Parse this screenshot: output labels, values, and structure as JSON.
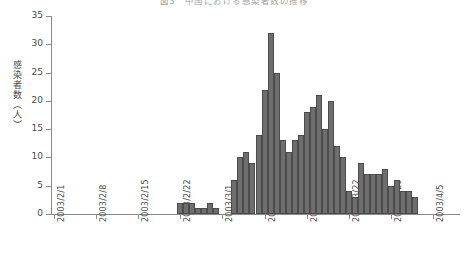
{
  "chart_data": {
    "type": "bar",
    "title": "図3　中国における感染者数の推移",
    "xlabel": "",
    "ylabel": "感染者数（人）",
    "ylim": [
      0,
      35
    ],
    "ytick_values": [
      0,
      5,
      10,
      15,
      20,
      25,
      30,
      35
    ],
    "ytick_labels": [
      "0",
      "5",
      "10",
      "15",
      "20",
      "25",
      "30",
      "35"
    ],
    "xtick_labels": [
      "2003/2/1",
      "2003/2/8",
      "2003/2/15",
      "2003/2/22",
      "2003/3/1",
      "2003/3/8",
      "2003/3/15",
      "2003/3/22",
      "2003/3/29",
      "2003/4/5"
    ],
    "xtick_positions_days": [
      0,
      7,
      14,
      21,
      28,
      35,
      42,
      49,
      56,
      63
    ],
    "grid": false,
    "legend": false,
    "bar_color": "#6e6e6e",
    "bar_edge_color": "#4c4c4c",
    "axis_color": "#8a8a8a",
    "x_start_label": "2003/2/1",
    "x_end_label": "2003/4/5",
    "categories": [
      "2003/2/1",
      "2003/2/2",
      "2003/2/3",
      "2003/2/4",
      "2003/2/5",
      "2003/2/6",
      "2003/2/7",
      "2003/2/8",
      "2003/2/9",
      "2003/2/10",
      "2003/2/11",
      "2003/2/12",
      "2003/2/13",
      "2003/2/14",
      "2003/2/15",
      "2003/2/16",
      "2003/2/17",
      "2003/2/18",
      "2003/2/19",
      "2003/2/20",
      "2003/2/21",
      "2003/2/22",
      "2003/2/23",
      "2003/2/24",
      "2003/2/25",
      "2003/2/26",
      "2003/2/27",
      "2003/2/28",
      "2003/3/1",
      "2003/3/2",
      "2003/3/3",
      "2003/3/4",
      "2003/3/5",
      "2003/3/6",
      "2003/3/7",
      "2003/3/8",
      "2003/3/9",
      "2003/3/10",
      "2003/3/11",
      "2003/3/12",
      "2003/3/13",
      "2003/3/14",
      "2003/3/15",
      "2003/3/16",
      "2003/3/17",
      "2003/3/18",
      "2003/3/19",
      "2003/3/20",
      "2003/3/21",
      "2003/3/22",
      "2003/3/23",
      "2003/3/24",
      "2003/3/25",
      "2003/3/26",
      "2003/3/27",
      "2003/3/28",
      "2003/3/29",
      "2003/3/30",
      "2003/3/31",
      "2003/4/1",
      "2003/4/2",
      "2003/4/3",
      "2003/4/4",
      "2003/4/5"
    ],
    "values": [
      0,
      0,
      0,
      0,
      0,
      0,
      0,
      0,
      0,
      0,
      0,
      0,
      0,
      0,
      0,
      0,
      0,
      0,
      0,
      0,
      0,
      2,
      2,
      2,
      1,
      1,
      2,
      1,
      0,
      0,
      6,
      10,
      11,
      9,
      14,
      22,
      32,
      25,
      13,
      11,
      13,
      14,
      18,
      19,
      21,
      15,
      20,
      12,
      10,
      4,
      3,
      9,
      7,
      7,
      7,
      8,
      5,
      6,
      4,
      4,
      3,
      0,
      0,
      0
    ]
  }
}
